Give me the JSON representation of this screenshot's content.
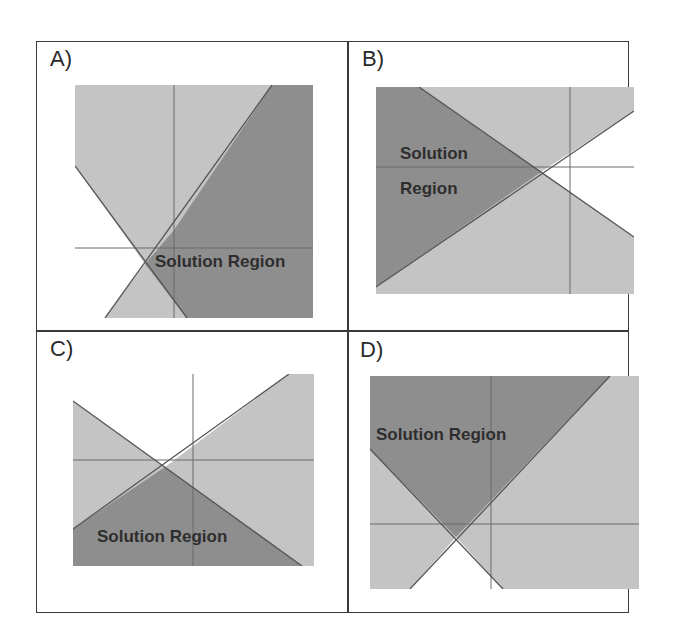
{
  "panels": [
    {
      "id": "A",
      "label": "A)",
      "solution_text": "Solution Region"
    },
    {
      "id": "B",
      "label": "B)",
      "solution_text_line1": "Solution",
      "solution_text_line2": "Region"
    },
    {
      "id": "C",
      "label": "C)",
      "solution_text": "Solution Region"
    },
    {
      "id": "D",
      "label": "D)",
      "solution_text": "Solution Region"
    }
  ],
  "colors": {
    "light_shade": "#c4c4c4",
    "dark_shade": "#8e8e8e",
    "unshaded": "#ffffff",
    "line": "#555555",
    "axis": "#6a6a6a",
    "border": "#3a3a3a"
  }
}
